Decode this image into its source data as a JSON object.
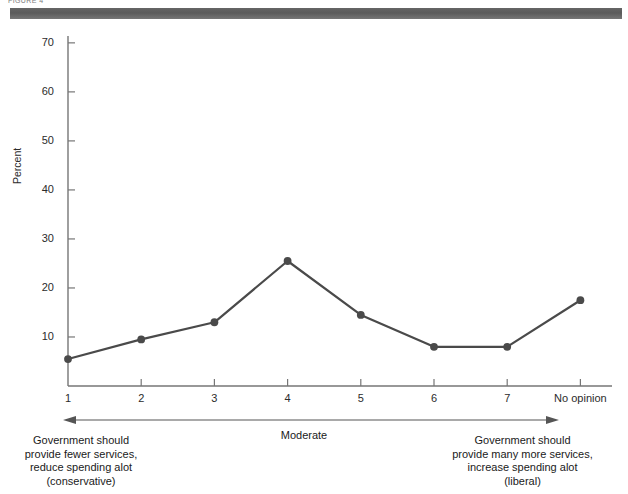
{
  "header": {
    "cropped_text": "FIGURE 4",
    "bar_color": "#555555"
  },
  "chart_data": {
    "type": "line",
    "title": "",
    "xlabel": "",
    "ylabel": "Percent",
    "categories": [
      "1",
      "2",
      "3",
      "4",
      "5",
      "6",
      "7",
      "No opinion"
    ],
    "values": [
      5.5,
      9.5,
      13,
      25.5,
      14.5,
      8,
      8,
      17.5
    ],
    "ylim": [
      0,
      70
    ],
    "yticks": [
      10,
      20,
      30,
      40,
      50,
      60,
      70
    ],
    "ytick_labels": [
      "10",
      "20",
      "30",
      "40",
      "50",
      "60",
      "70"
    ],
    "grid": false,
    "legend": null,
    "series_color": "#4a4a4a",
    "marker": "circle",
    "annotations": {
      "left": "Government should\nprovide fewer services,\nreduce spending alot\n(conservative)",
      "middle": "Moderate",
      "right": "Government should\nprovide many more services,\nincrease spending alot\n(liberal)",
      "arrow": "double-headed-horizontal"
    }
  }
}
